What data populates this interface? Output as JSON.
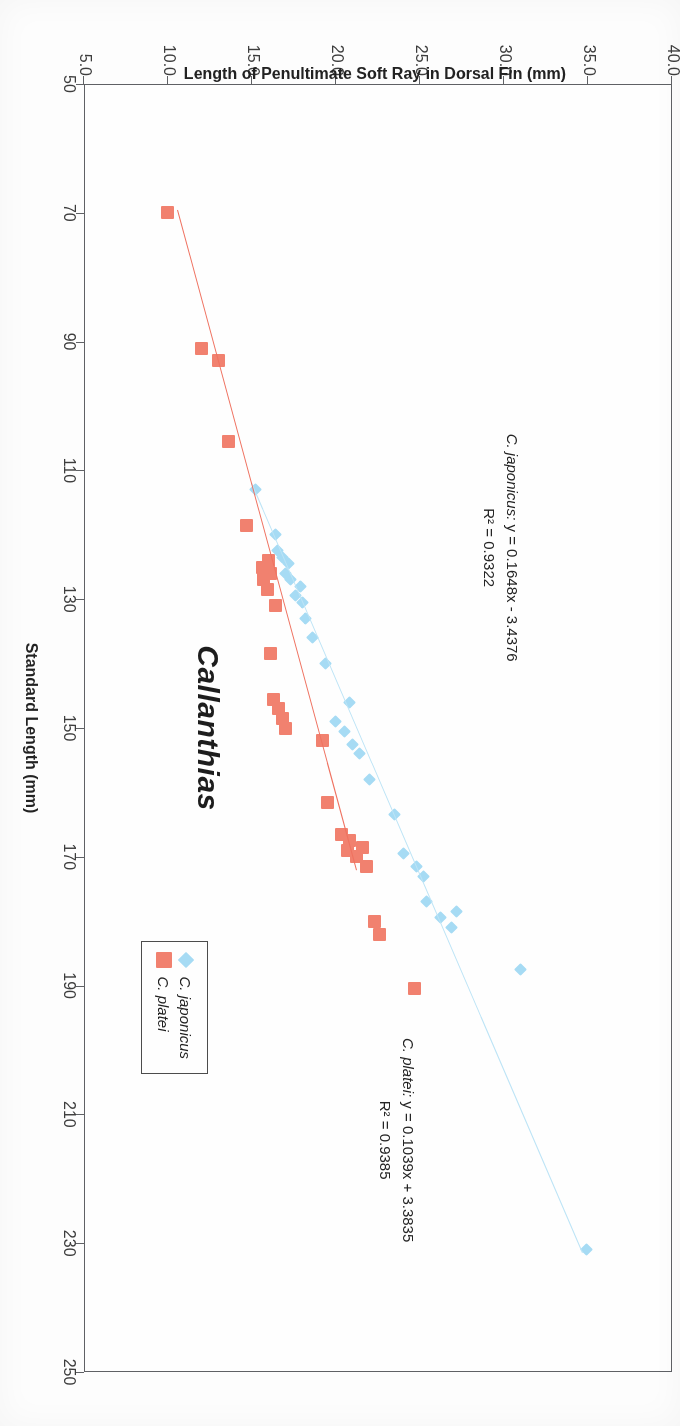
{
  "chart_data": {
    "type": "scatter",
    "title": "Callanthias",
    "xlabel": "Standard Length (mm)",
    "ylabel": "Length of Penultimate Soft Ray in Dorsal Fin (mm)",
    "xlim": [
      50,
      250
    ],
    "ylim": [
      5.0,
      40.0
    ],
    "xticks": [
      "50",
      "70",
      "90",
      "110",
      "130",
      "150",
      "170",
      "190",
      "210",
      "230",
      "250"
    ],
    "yticks": [
      "5.0",
      "10.0",
      "15.0",
      "20.0",
      "25.0",
      "30.0",
      "35.0",
      "40.0"
    ],
    "grid": false,
    "legend_position": "bottom-right-inside",
    "series": [
      {
        "name": "C. japonicus",
        "marker": "diamond",
        "color": "#a6dcf5",
        "trendline_color": "#bde5f7",
        "equation": "y = 0.1648x - 3.4376",
        "r2": "R² = 0.9322",
        "slope": 0.1648,
        "intercept": -3.4376,
        "points": [
          [
            231.0,
            34.9
          ],
          [
            187.5,
            31.0
          ],
          [
            181.0,
            26.9
          ],
          [
            179.5,
            26.2
          ],
          [
            178.5,
            27.2
          ],
          [
            177.0,
            25.4
          ],
          [
            173.0,
            25.2
          ],
          [
            171.5,
            24.8
          ],
          [
            169.5,
            24.0
          ],
          [
            163.5,
            23.5
          ],
          [
            158.0,
            22.0
          ],
          [
            154.0,
            21.4
          ],
          [
            152.5,
            21.0
          ],
          [
            150.5,
            20.5
          ],
          [
            149.0,
            20.0
          ],
          [
            146.0,
            20.8
          ],
          [
            140.0,
            19.4
          ],
          [
            136.0,
            18.6
          ],
          [
            133.0,
            18.2
          ],
          [
            130.5,
            18.0
          ],
          [
            129.5,
            17.6
          ],
          [
            128.0,
            17.9
          ],
          [
            127.0,
            17.3
          ],
          [
            126.0,
            17.0
          ],
          [
            124.5,
            17.2
          ],
          [
            123.5,
            16.8
          ],
          [
            122.5,
            16.5
          ],
          [
            120.0,
            16.4
          ],
          [
            113.0,
            15.2
          ]
        ]
      },
      {
        "name": "C. platei",
        "marker": "square",
        "color": "#f2806d",
        "trendline_color": "#f0705e",
        "equation": "y = 0.1039x + 3.3835",
        "r2": "R² = 0.9385",
        "slope": 0.1039,
        "intercept": 3.3835,
        "points": [
          [
            190.5,
            24.7
          ],
          [
            182.0,
            22.6
          ],
          [
            180.0,
            22.3
          ],
          [
            171.5,
            21.8
          ],
          [
            170.0,
            21.2
          ],
          [
            169.0,
            20.7
          ],
          [
            168.5,
            21.6
          ],
          [
            167.5,
            20.8
          ],
          [
            166.5,
            20.3
          ],
          [
            161.5,
            19.5
          ],
          [
            152.0,
            19.2
          ],
          [
            150.0,
            17.0
          ],
          [
            148.5,
            16.8
          ],
          [
            147.0,
            16.6
          ],
          [
            145.5,
            16.3
          ],
          [
            138.5,
            16.1
          ],
          [
            131.0,
            16.4
          ],
          [
            128.5,
            15.9
          ],
          [
            127.0,
            15.7
          ],
          [
            126.0,
            16.1
          ],
          [
            125.0,
            15.6
          ],
          [
            124.0,
            16.0
          ],
          [
            118.5,
            14.7
          ],
          [
            105.5,
            13.6
          ],
          [
            93.0,
            13.0
          ],
          [
            91.0,
            12.0
          ],
          [
            70.0,
            10.0
          ]
        ]
      }
    ],
    "annotations": [
      {
        "id": "japonicus-eqn",
        "species": "C. japonicus:",
        "line1": " y = 0.1648x - 3.4376",
        "line2": "R² = 0.9322"
      },
      {
        "id": "platei-eqn",
        "species": "C. platei:",
        "line1": " y = 0.1039x + 3.3835",
        "line2": "R² = 0.9385"
      }
    ]
  },
  "legend": {
    "items": [
      {
        "label": "C. japonicus",
        "marker": "diamond"
      },
      {
        "label": "C. platei",
        "marker": "square"
      }
    ]
  },
  "colors": {
    "japonicus": "#a6dcf5",
    "platei": "#f2806d",
    "frame": "#5d5f63",
    "text": "#1f1f1f"
  }
}
